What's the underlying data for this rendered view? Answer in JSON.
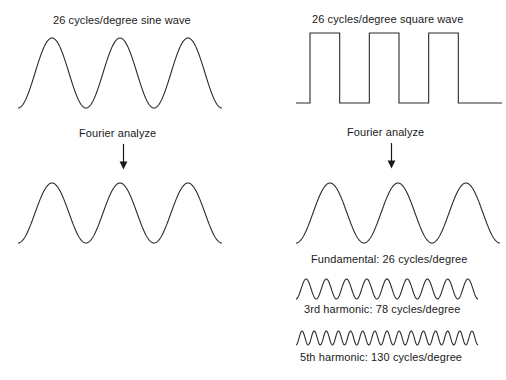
{
  "figure": {
    "width": 506,
    "height": 380,
    "background": "#ffffff",
    "stroke_color": "#2b2b2b",
    "text_color": "#1a1a1a"
  },
  "columns": {
    "left": {
      "input_label": "26 cycles/degree sine wave",
      "operation_label": "Fourier analyze",
      "output_label": ""
    },
    "right": {
      "input_label": "26 cycles/degree square wave",
      "operation_label": "Fourier analyze",
      "components": [
        {
          "label": "Fundamental: 26 cycles/degree"
        },
        {
          "label": "3rd harmonic: 78 cycles/degree"
        },
        {
          "label": "5th harmonic: 130 cycles/degree"
        }
      ]
    }
  },
  "chart_data": {
    "type": "line",
    "title": "",
    "xlabel": "",
    "ylabel": "",
    "grid": false,
    "legend": "none",
    "waveforms": [
      {
        "name": "input-sine-wave",
        "label": "26 cycles/degree sine wave",
        "shape": "sine",
        "cycles": 3,
        "frequency_cycles_per_degree": 26,
        "amplitude_px": 35,
        "phase": "starts-at-trough",
        "x_px": [
          18,
          220
        ],
        "y_center_px": 73
      },
      {
        "name": "input-square-wave",
        "label": "26 cycles/degree square wave",
        "shape": "square",
        "cycles": 3,
        "frequency_cycles_per_degree": 26,
        "amplitude_px": 70,
        "duty_cycle": 0.5,
        "x_px": [
          296,
          500
        ],
        "y_top_px": 31,
        "y_bottom_px": 104
      },
      {
        "name": "output-sine-wave",
        "label": "",
        "shape": "sine",
        "cycles": 3,
        "frequency_cycles_per_degree": 26,
        "amplitude_px": 30,
        "phase": "starts-at-trough",
        "x_px": [
          18,
          220
        ],
        "y_center_px": 213
      },
      {
        "name": "fundamental-wave",
        "label": "Fundamental: 26 cycles/degree",
        "shape": "sine",
        "cycles": 3,
        "frequency_cycles_per_degree": 26,
        "amplitude_px": 30,
        "phase": "starts-at-trough",
        "x_px": [
          296,
          498
        ],
        "y_center_px": 213
      },
      {
        "name": "third-harmonic-wave",
        "label": "3rd harmonic: 78 cycles/degree",
        "shape": "sine",
        "cycles": 9,
        "frequency_cycles_per_degree": 78,
        "amplitude_px": 10,
        "phase": "starts-at-trough",
        "x_px": [
          296,
          478
        ],
        "y_center_px": 289
      },
      {
        "name": "fifth-harmonic-wave",
        "label": "5th harmonic: 130 cycles/degree",
        "shape": "sine",
        "cycles": 15,
        "frequency_cycles_per_degree": 130,
        "amplitude_px": 7,
        "phase": "starts-at-trough",
        "x_px": [
          296,
          478
        ],
        "y_center_px": 338
      }
    ],
    "annotations": [
      {
        "name": "left-fourier-arrow",
        "text": "Fourier analyze",
        "x_px": 123,
        "y_from_px": 144,
        "y_to_px": 168
      },
      {
        "name": "right-fourier-arrow",
        "text": "Fourier analyze",
        "x_px": 391,
        "y_from_px": 143,
        "y_to_px": 167
      }
    ]
  }
}
